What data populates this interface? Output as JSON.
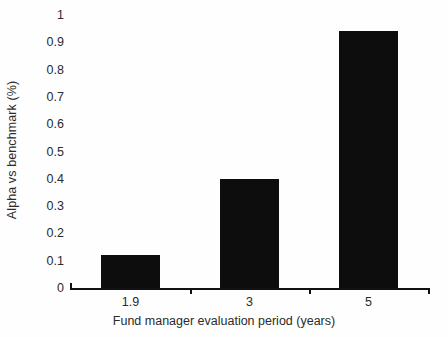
{
  "chart_data": {
    "type": "bar",
    "title": "",
    "subtitle": "",
    "categories": [
      "1.9",
      "3",
      "5"
    ],
    "values": [
      0.12,
      0.4,
      0.94
    ],
    "series": [
      {
        "name": "Alpha vs benchmark",
        "values": [
          0.12,
          0.4,
          0.94
        ]
      }
    ],
    "xlabel": "Fund manager evaluation period (years)",
    "ylabel": "Alpha vs benchmark (%)",
    "ylim": [
      0,
      1
    ],
    "yticks": [
      "0",
      "0.1",
      "0.2",
      "0.3",
      "0.4",
      "0.5",
      "0.6",
      "0.7",
      "0.8",
      "0.9",
      "1"
    ],
    "ytick_values": [
      0,
      0.1,
      0.2,
      0.3,
      0.4,
      0.5,
      0.6,
      0.7,
      0.8,
      0.9,
      1
    ],
    "grid": false,
    "legend": false,
    "legend_position": "none",
    "bar_color": "#0d0d0d",
    "background_color": "#fefefe",
    "text_color": "#2b2b2b",
    "axis_color": "#111111",
    "annotations": []
  }
}
